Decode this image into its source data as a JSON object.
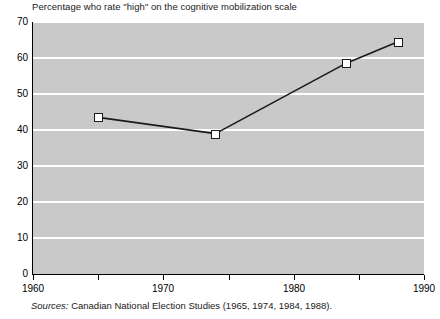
{
  "chart_data": {
    "type": "line",
    "title": "Percentage who rate \"high\" on the cognitive mobilization scale",
    "xlabel": "",
    "ylabel": "",
    "x": [
      1965,
      1974,
      1984,
      1988
    ],
    "values": [
      43.5,
      39,
      58.5,
      64.5
    ],
    "series": [
      {
        "name": "Percentage rating high on cognitive mobilization",
        "values": [
          43.5,
          39,
          58.5,
          64.5
        ]
      }
    ],
    "xlim": [
      1960,
      1990
    ],
    "ylim": [
      0,
      70
    ],
    "yticks": [
      0,
      10,
      20,
      30,
      40,
      50,
      60,
      70
    ],
    "ytick_labels": [
      "0",
      "10",
      "20",
      "30",
      "40",
      "50",
      "60",
      "70"
    ],
    "xticks": [
      1960,
      1965,
      1970,
      1975,
      1980,
      1985,
      1990
    ],
    "xtick_labels": [
      "1960",
      "",
      "1970",
      "",
      "1980",
      "",
      "1990"
    ],
    "grid": "horizontal",
    "legend": "none",
    "marker": "open-square",
    "plot_background": "#c9c9c9",
    "gridline_color": "#ffffff",
    "line_color": "#1a1a1a",
    "marker_fill": "#ffffff",
    "marker_edge": "#1a1a1a"
  },
  "source": {
    "label": "Sources:",
    "text": " Canadian National Election Studies (1965, 1974, 1984, 1988)."
  }
}
